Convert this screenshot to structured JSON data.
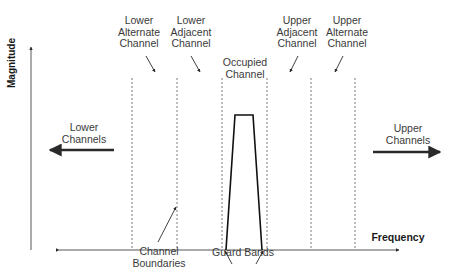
{
  "diagram": {
    "axes": {
      "y_label": "Magnitude",
      "x_label": "Frequency"
    },
    "channel_labels": {
      "lower_alternate": "Lower\nAlternate\nChannel",
      "lower_adjacent": "Lower\nAdjacent\nChannel",
      "occupied": "Occupied\nChannel",
      "upper_adjacent": "Upper\nAdjacent\nChannel",
      "upper_alternate": "Upper\nAlternate\nChannel"
    },
    "direction_labels": {
      "lower": "Lower\nChannels",
      "upper": "Upper\nChannels"
    },
    "annotations": {
      "boundaries": "Channel\nBoundaries",
      "guard_bands": "Guard Bands"
    },
    "channel_boundaries_x": [
      132,
      177,
      222,
      267,
      311,
      355
    ],
    "colors": {
      "line": "#2a2a2a",
      "dashed": "#555555",
      "text": "#3a3a3a"
    }
  }
}
